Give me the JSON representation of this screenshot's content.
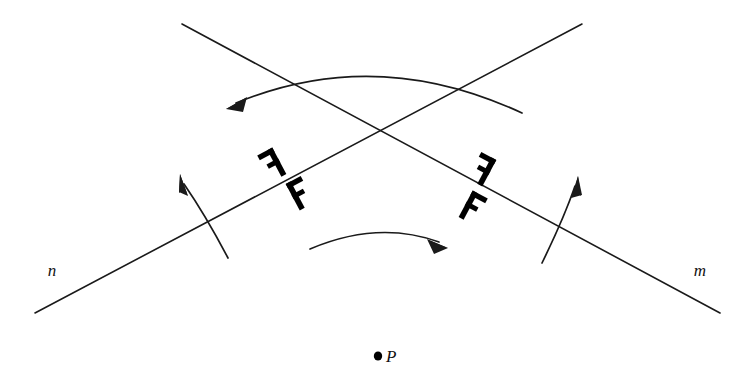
{
  "figure": {
    "background_color": "#ffffff",
    "stroke_color": "#1a1a1a",
    "glyph_color": "#000000",
    "width": 742,
    "height": 378
  },
  "labels": {
    "line_n": "n",
    "line_m": "m",
    "point_p": "P"
  },
  "lines": [
    {
      "name": "n",
      "label": "n",
      "from": [
        182,
        24
      ],
      "to": [
        720,
        313
      ],
      "label_pos": [
        52,
        276
      ]
    },
    {
      "name": "m",
      "label": "m",
      "from": [
        582,
        24
      ],
      "to": [
        35,
        313
      ],
      "label_pos": [
        700,
        276
      ]
    }
  ],
  "intersection": [
    378,
    132
  ],
  "point": {
    "name": "P",
    "label": "P",
    "dot": [
      378,
      356
    ],
    "label_pos": [
      386,
      362
    ]
  },
  "glyphs": [
    {
      "name": "f-upper-left",
      "mirrored": true,
      "x": 277,
      "y": 162,
      "rotation": -28,
      "letter": "F"
    },
    {
      "name": "f-lower-left",
      "mirrored": false,
      "x": 295,
      "y": 196,
      "rotation": -28,
      "letter": "F"
    },
    {
      "name": "f-upper-right",
      "mirrored": true,
      "x": 487,
      "y": 172,
      "rotation": 28,
      "letter": "F"
    },
    {
      "name": "f-lower-right",
      "mirrored": false,
      "x": 468,
      "y": 205,
      "rotation": 28,
      "letter": "F"
    }
  ],
  "arcs": [
    {
      "name": "top-rotation-arc",
      "direction": "right-to-left",
      "arrowhead": "left-end",
      "start": [
        522,
        113
      ],
      "control": [
        376,
        45
      ],
      "end": [
        232,
        105
      ]
    },
    {
      "name": "center-rotation-arc",
      "direction": "left-to-right",
      "arrowhead": "right-end",
      "start": [
        310,
        249
      ],
      "control": [
        378,
        222
      ],
      "end": [
        445,
        246
      ]
    },
    {
      "name": "left-reflection-arc",
      "direction": "bottom-to-top",
      "arrowhead": "top-end",
      "start": [
        228,
        258
      ],
      "control": [
        205,
        215
      ],
      "end": [
        180,
        176
      ]
    },
    {
      "name": "right-reflection-arc",
      "direction": "bottom-to-top",
      "arrowhead": "top-end",
      "start": [
        542,
        263
      ],
      "control": [
        562,
        215
      ],
      "end": [
        578,
        178
      ]
    }
  ]
}
